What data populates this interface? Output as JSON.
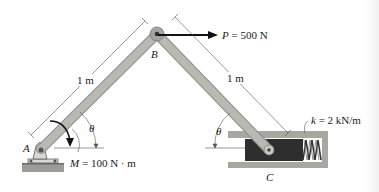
{
  "diagram": {
    "type": "mechanism-statics",
    "colors": {
      "link": "#b9b9b4",
      "link_edge": "#8f8f8a",
      "housing": "#a8a8a3",
      "piston": "#2e2e2e",
      "ground": "#9c9c97",
      "arrow": "#111111",
      "dim_line": "#555555"
    },
    "points": {
      "A": {
        "label": "A"
      },
      "B": {
        "label": "B"
      },
      "C": {
        "label": "C"
      }
    },
    "labels": {
      "point_A": "A",
      "point_B": "B",
      "point_C": "C",
      "length_AB": "1 m",
      "length_BC": "1 m",
      "theta_left": "θ",
      "theta_right": "θ",
      "force": {
        "symbol": "P",
        "text": " = 500 N"
      },
      "moment": {
        "symbol": "M",
        "text": " = 100 N · m"
      },
      "spring": {
        "symbol": "k",
        "text": " = 2 kN/m"
      }
    },
    "icons": {
      "force_arrow": "arrow-right",
      "moment_arrow": "curved-arrow-clockwise",
      "pin_support": "pin-support",
      "spring": "coil-spring"
    }
  }
}
